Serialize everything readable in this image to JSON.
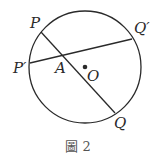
{
  "figure": {
    "caption": "圖 2",
    "circle": {
      "cx": 85,
      "cy": 67,
      "r": 56,
      "center_label": "O"
    },
    "points": {
      "P": {
        "label": "P",
        "x": 41,
        "y": 32
      },
      "Q": {
        "label": "Q",
        "x": 115,
        "y": 113
      },
      "P_prime": {
        "label": "P′",
        "x": 30,
        "y": 63
      },
      "Q_prime": {
        "label": "Q′",
        "x": 132,
        "y": 39
      },
      "A": {
        "label": "A",
        "x": 62,
        "y": 55
      },
      "O": {
        "label": "O",
        "x": 85,
        "y": 67
      }
    },
    "chords": [
      {
        "name": "PQ",
        "from": "P",
        "to": "Q"
      },
      {
        "name": "P'Q'",
        "from": "P′",
        "to": "Q′"
      }
    ],
    "colors": {
      "stroke": "#2a2a2a",
      "caption": "#555555"
    }
  }
}
